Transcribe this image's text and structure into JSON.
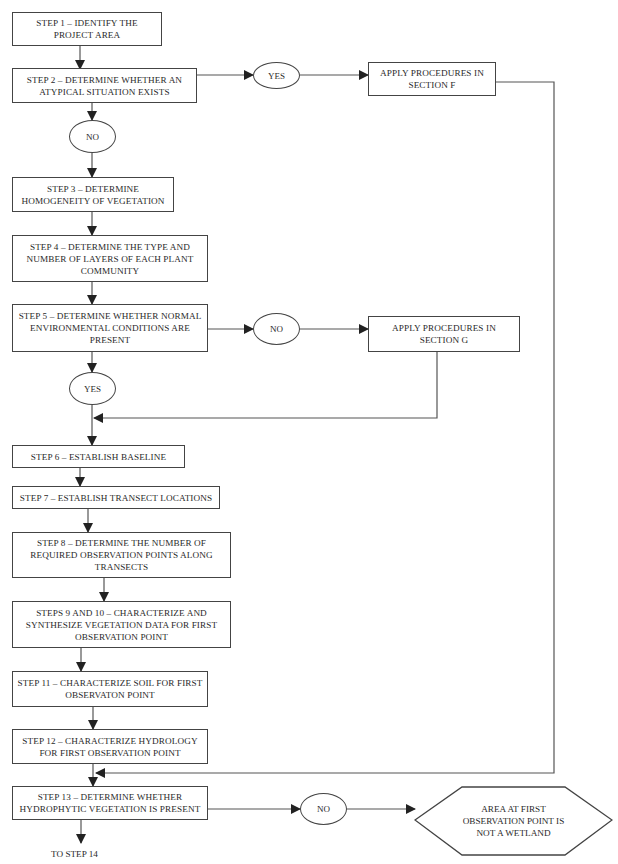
{
  "flowchart": {
    "steps": [
      {
        "id": "step1",
        "text": "STEP 1 – IDENTIFY THE PROJECT AREA"
      },
      {
        "id": "step2",
        "text": "STEP 2 – DETERMINE WHETHER AN ATYPICAL SITUATION EXISTS"
      },
      {
        "id": "step3",
        "text": "STEP 3 – DETERMINE HOMOGENEITY OF VEGETATION"
      },
      {
        "id": "step4",
        "text": "STEP 4 – DETERMINE THE TYPE AND NUMBER OF LAYERS OF EACH PLANT COMMUNITY"
      },
      {
        "id": "step5",
        "text": "STEP 5 – DETERMINE WHETHER NORMAL ENVIRONMENTAL CONDITIONS ARE PRESENT"
      },
      {
        "id": "step6",
        "text": "STEP 6 – ESTABLISH BASELINE"
      },
      {
        "id": "step7",
        "text": "STEP 7 – ESTABLISH TRANSECT LOCATIONS"
      },
      {
        "id": "step8",
        "text": "STEP 8 – DETERMINE THE NUMBER OF REQUIRED OBSERVATION POINTS ALONG TRANSECTS"
      },
      {
        "id": "step9_10",
        "text": "STEPS 9 AND 10 – CHARACTERIZE AND SYNTHESIZE VEGETATION DATA FOR FIRST OBSERVATION POINT"
      },
      {
        "id": "step11",
        "text": "STEP 11 – CHARACTERIZE SOIL FOR FIRST OBSERVATON POINT"
      },
      {
        "id": "step12",
        "text": "STEP 12 – CHARACTERIZE HYDROLOGY FOR FIRST OBSERVATION POINT"
      },
      {
        "id": "step13",
        "text": "STEP 13 – DETERMINE WHETHER HYDROPHYTIC VEGETATION IS PRESENT"
      }
    ],
    "decisions": {
      "step2_yes": "YES",
      "step2_no": "NO",
      "step5_no": "NO",
      "step5_yes": "YES",
      "step13_no": "NO"
    },
    "side_boxes": {
      "section_f": "APPLY PROCEDURES IN SECTION F",
      "section_g": "APPLY PROCEDURES IN SECTION G"
    },
    "terminal": {
      "not_wetland": "AREA AT FIRST OBSERVATION POINT IS NOT A WETLAND"
    },
    "continuation": "TO STEP 14"
  }
}
